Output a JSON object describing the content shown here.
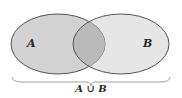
{
  "diagram": {
    "type": "venn",
    "sets": [
      {
        "label": "A",
        "fill": "#d4d4d4"
      },
      {
        "label": "B",
        "fill": "#e8e8e8"
      }
    ],
    "intersection_fill": "#b8b8b8",
    "stroke": "#555555",
    "caption": "A ∪ B"
  }
}
